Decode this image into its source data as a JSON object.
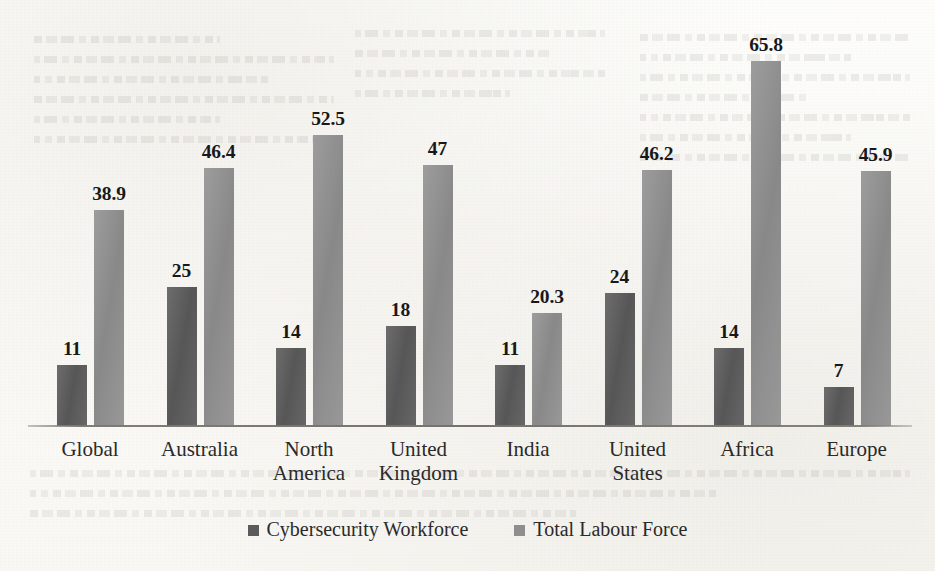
{
  "chart_data": {
    "type": "bar",
    "title": "",
    "subtitle": "",
    "xlabel": "",
    "ylabel": "",
    "grid": false,
    "y_axis_visible": false,
    "x_axis_visible": true,
    "legend_position": "bottom-center",
    "data_labels_shown": true,
    "ylim": [
      0,
      65.8
    ],
    "categories": [
      "Global",
      "Australia",
      "North America",
      "United Kingdom",
      "India",
      "United States",
      "Africa",
      "Europe"
    ],
    "category_lines": [
      [
        "Global"
      ],
      [
        "Australia"
      ],
      [
        "North",
        "America"
      ],
      [
        "United",
        "Kingdom"
      ],
      [
        "India"
      ],
      [
        "United",
        "States"
      ],
      [
        "Africa"
      ],
      [
        "Europe"
      ]
    ],
    "series": [
      {
        "name": "Cybersecurity Workforce",
        "color": "#5b5b5b",
        "values": [
          11,
          25,
          14,
          18,
          11,
          24,
          14,
          7
        ],
        "labels": [
          "11",
          "25",
          "14",
          "18",
          "11",
          "24",
          "14",
          "7"
        ]
      },
      {
        "name": "Total Labour Force",
        "color": "#8e8e8e",
        "values": [
          38.9,
          46.4,
          52.5,
          47,
          20.3,
          46.2,
          65.8,
          45.9
        ],
        "labels": [
          "38.9",
          "46.4",
          "52.5",
          "47",
          "20.3",
          "46.2",
          "65.8",
          "45.9"
        ]
      }
    ]
  },
  "legend": {
    "items": [
      {
        "label": "Cybersecurity Workforce",
        "swatch": "legend-swatch-dark"
      },
      {
        "label": "Total Labour Force",
        "swatch": "legend-swatch-light"
      }
    ]
  }
}
